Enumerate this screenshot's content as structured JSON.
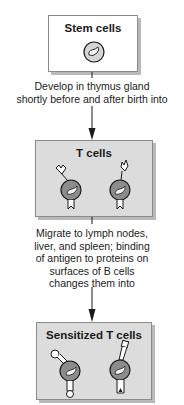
{
  "diagram": {
    "nodes": [
      {
        "id": "stem",
        "label": "Stem cells",
        "fill": "#ffffff"
      },
      {
        "id": "tcells",
        "label": "T cells",
        "fill": "#dcdcdc"
      },
      {
        "id": "sensitized",
        "label": "Sensitized T cells",
        "fill": "#dcdcdc"
      }
    ],
    "edges": [
      {
        "from": "stem",
        "to": "tcells",
        "label_lines": [
          "Develop in thymus gland",
          "shortly before and after birth into"
        ]
      },
      {
        "from": "tcells",
        "to": "sensitized",
        "label_lines": [
          "Migrate to lymph nodes,",
          "liver, and spleen; binding",
          "of antigen to proteins on",
          "surfaces of B cells",
          "changes them into"
        ]
      }
    ],
    "colors": {
      "cell_body": "#8c8c8c",
      "nucleus": "#f2f2f2",
      "stem_cell_body": "#d6d6d6",
      "outline": "#1a1a1a"
    }
  }
}
